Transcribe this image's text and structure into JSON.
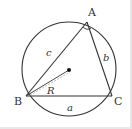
{
  "figure": {
    "vertices": {
      "A": "A",
      "B": "B",
      "C": "C"
    },
    "sides": {
      "a": "a",
      "b": "b",
      "c": "c"
    },
    "radius_label": "R",
    "colors": {
      "stroke": "#333333",
      "radius_dashed": "#999999",
      "background": "#ffffff"
    }
  }
}
